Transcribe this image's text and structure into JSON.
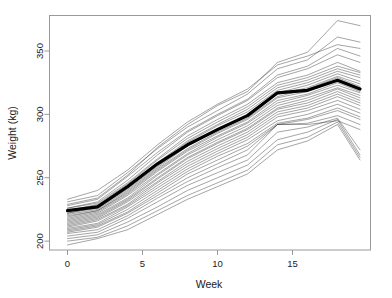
{
  "chart_data": {
    "type": "line",
    "title": "",
    "subtitle": "",
    "xlabel": "Week",
    "ylabel": "Weight (kg)",
    "xlim": [
      -1.2,
      20.2
    ],
    "ylim": [
      193,
      378
    ],
    "grid": false,
    "legend": null,
    "xticks": [
      0,
      5,
      10,
      15
    ],
    "xtick_labels": [
      "0",
      "5",
      "10",
      "15"
    ],
    "yticks": [
      200,
      250,
      300,
      350
    ],
    "ytick_labels": [
      "200",
      "250",
      "300",
      "350"
    ],
    "x": [
      0,
      2,
      4,
      6,
      8,
      10,
      12,
      14,
      16,
      18,
      19.5
    ],
    "annotations": [],
    "colors": {
      "subject_line": "#1a1a1a",
      "mean_line": "#000000",
      "axis": "#9a9a9a",
      "background": "#ffffff",
      "text": "#222222"
    },
    "mean_series": {
      "name": "Mean weight",
      "values": [
        224,
        227,
        243,
        261,
        276,
        288,
        299,
        317,
        319,
        327,
        320
      ],
      "style": "bold-overlay"
    },
    "series": [
      {
        "name": "subject-01",
        "values": [
          233,
          240,
          256,
          276,
          294,
          308,
          320,
          339,
          346,
          355,
          352
        ]
      },
      {
        "name": "subject-02",
        "values": [
          231,
          236,
          254,
          273,
          290,
          303,
          316,
          336,
          343,
          361,
          357
        ]
      },
      {
        "name": "subject-03",
        "values": [
          229,
          234,
          252,
          274,
          292,
          307,
          318,
          341,
          349,
          374,
          370
        ]
      },
      {
        "name": "subject-04",
        "values": [
          228,
          233,
          251,
          270,
          287,
          300,
          312,
          331,
          338,
          352,
          346
        ]
      },
      {
        "name": "subject-05",
        "values": [
          226,
          231,
          248,
          268,
          286,
          299,
          311,
          329,
          336,
          347,
          341
        ]
      },
      {
        "name": "subject-06",
        "values": [
          226,
          230,
          246,
          265,
          283,
          296,
          308,
          325,
          331,
          341,
          334
        ]
      },
      {
        "name": "subject-07",
        "values": [
          224,
          229,
          245,
          264,
          281,
          294,
          306,
          323,
          329,
          338,
          333
        ]
      },
      {
        "name": "subject-08",
        "values": [
          224,
          228,
          243,
          262,
          279,
          292,
          304,
          321,
          327,
          336,
          331
        ]
      },
      {
        "name": "subject-09",
        "values": [
          222,
          227,
          242,
          261,
          278,
          291,
          302,
          319,
          325,
          334,
          329
        ]
      },
      {
        "name": "subject-10",
        "values": [
          222,
          226,
          241,
          259,
          276,
          289,
          300,
          317,
          323,
          332,
          326
        ]
      },
      {
        "name": "subject-11",
        "values": [
          221,
          225,
          240,
          258,
          275,
          288,
          299,
          316,
          321,
          330,
          324
        ]
      },
      {
        "name": "subject-12",
        "values": [
          220,
          224,
          239,
          257,
          273,
          286,
          297,
          314,
          320,
          329,
          322
        ]
      },
      {
        "name": "subject-13",
        "values": [
          219,
          224,
          238,
          256,
          272,
          285,
          296,
          313,
          318,
          327,
          320
        ]
      },
      {
        "name": "subject-14",
        "values": [
          218,
          223,
          237,
          255,
          271,
          283,
          294,
          311,
          316,
          325,
          318
        ]
      },
      {
        "name": "subject-15",
        "values": [
          217,
          222,
          236,
          253,
          269,
          282,
          293,
          309,
          315,
          323,
          317
        ]
      },
      {
        "name": "subject-16",
        "values": [
          216,
          221,
          234,
          252,
          268,
          280,
          291,
          307,
          313,
          321,
          315
        ]
      },
      {
        "name": "subject-17",
        "values": [
          215,
          220,
          233,
          250,
          266,
          278,
          289,
          305,
          311,
          320,
          313
        ]
      },
      {
        "name": "subject-18",
        "values": [
          214,
          219,
          232,
          249,
          265,
          277,
          288,
          304,
          309,
          318,
          311
        ]
      },
      {
        "name": "subject-19",
        "values": [
          213,
          218,
          231,
          247,
          263,
          275,
          286,
          302,
          307,
          316,
          309
        ]
      },
      {
        "name": "subject-20",
        "values": [
          212,
          217,
          229,
          246,
          261,
          273,
          284,
          300,
          305,
          314,
          307
        ]
      },
      {
        "name": "subject-21",
        "values": [
          211,
          216,
          228,
          244,
          259,
          271,
          282,
          298,
          303,
          311,
          304
        ]
      },
      {
        "name": "subject-22",
        "values": [
          210,
          214,
          227,
          242,
          257,
          269,
          280,
          295,
          300,
          308,
          301
        ]
      },
      {
        "name": "subject-23",
        "values": [
          209,
          213,
          225,
          240,
          255,
          267,
          277,
          293,
          297,
          305,
          298
        ]
      },
      {
        "name": "subject-24",
        "values": [
          208,
          212,
          223,
          238,
          253,
          264,
          275,
          292,
          296,
          303,
          296
        ]
      },
      {
        "name": "subject-25",
        "values": [
          207,
          211,
          222,
          236,
          250,
          261,
          272,
          292,
          293,
          299,
          292
        ]
      },
      {
        "name": "subject-26",
        "values": [
          206,
          209,
          220,
          234,
          247,
          258,
          268,
          292,
          292,
          295,
          288
        ]
      },
      {
        "name": "subject-27",
        "values": [
          204,
          207,
          218,
          231,
          244,
          254,
          264,
          286,
          290,
          297,
          272
        ]
      },
      {
        "name": "subject-28",
        "values": [
          202,
          205,
          215,
          227,
          240,
          250,
          260,
          280,
          286,
          296,
          268
        ]
      },
      {
        "name": "subject-29",
        "values": [
          200,
          203,
          212,
          224,
          236,
          246,
          256,
          276,
          282,
          294,
          266
        ]
      },
      {
        "name": "subject-30",
        "values": [
          197,
          202,
          209,
          221,
          233,
          243,
          253,
          272,
          279,
          292,
          264
        ]
      }
    ]
  }
}
